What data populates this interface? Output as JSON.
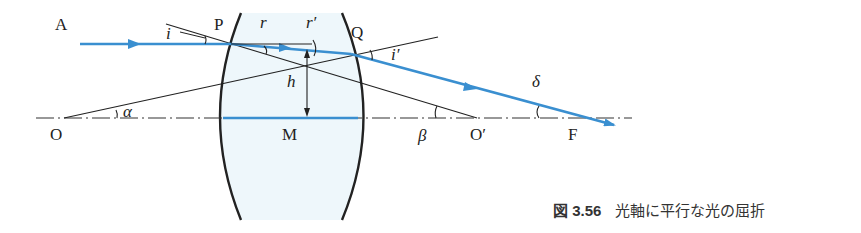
{
  "diagram": {
    "points": {
      "A": "A",
      "P": "P",
      "Q": "Q",
      "O": "O",
      "M": "M",
      "O_prime": "O′",
      "F": "F"
    },
    "angles": {
      "i": "i",
      "r": "r",
      "r_prime": "r′",
      "i_prime": "i′",
      "alpha": "α",
      "beta": "β",
      "delta": "δ"
    },
    "height_label": "h",
    "colors": {
      "ray": "#3a8fd0",
      "lens_fill": "#eef7fb",
      "line": "#222222"
    }
  },
  "caption": {
    "figure_number": "図 3.56",
    "text": "光軸に平行な光の屈折"
  }
}
